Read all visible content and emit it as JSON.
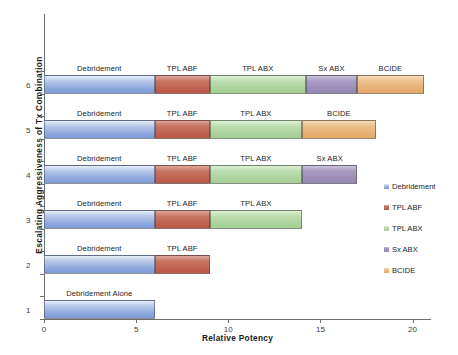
{
  "chart_data": {
    "type": "bar",
    "orientation": "horizontal",
    "stacked": true,
    "title": "",
    "xlabel": "Relative Potency",
    "ylabel": "Escalating Aggressiveness of  Tx  Combination",
    "xlim": [
      0,
      21
    ],
    "xticks": [
      0,
      5,
      10,
      15,
      20
    ],
    "xticklabels": [
      "0",
      "5",
      "10",
      "15",
      "20"
    ],
    "yticks": [
      1,
      2,
      3,
      4,
      5,
      6
    ],
    "yticklabels": [
      "1",
      "2",
      "3",
      "4",
      "5",
      "6"
    ],
    "grid": false,
    "legend_position": "right",
    "series": [
      {
        "name": "Debridement",
        "color": "#8fa9dd",
        "values": [
          6,
          6,
          6,
          6,
          6,
          6
        ]
      },
      {
        "name": "TPL ABF",
        "color": "#c0604f",
        "values": [
          0,
          3,
          3,
          3,
          3,
          3
        ]
      },
      {
        "name": "TPL ABX",
        "color": "#a9d29b",
        "values": [
          0,
          0,
          5,
          5,
          5,
          5
        ]
      },
      {
        "name": "Sx ABX",
        "color": "#9a8cb7",
        "values": [
          0,
          0,
          0,
          3,
          0,
          3
        ]
      },
      {
        "name": "BCIDE",
        "color": "#e6ae72",
        "values": [
          0,
          0,
          0,
          0,
          4,
          3.6
        ]
      }
    ],
    "bars": [
      {
        "category": "1",
        "total": 6,
        "segments": [
          {
            "series": "Debridement",
            "label": "Debridement Alone",
            "start": 0,
            "end": 6,
            "color": "#8fa9dd",
            "fill": "c-debridement"
          }
        ]
      },
      {
        "category": "2",
        "total": 9,
        "segments": [
          {
            "series": "Debridement",
            "label": "Debridement",
            "start": 0,
            "end": 6,
            "color": "#8fa9dd",
            "fill": "c-debridement"
          },
          {
            "series": "TPL ABF",
            "label": "TPL ABF",
            "start": 6,
            "end": 9,
            "color": "#c0604f",
            "fill": "c-tplabf"
          }
        ]
      },
      {
        "category": "3",
        "total": 14,
        "segments": [
          {
            "series": "Debridement",
            "label": "Debridement",
            "start": 0,
            "end": 6,
            "color": "#8fa9dd",
            "fill": "c-debridement"
          },
          {
            "series": "TPL ABF",
            "label": "TPL ABF",
            "start": 6,
            "end": 9,
            "color": "#c0604f",
            "fill": "c-tplabf"
          },
          {
            "series": "TPL ABX",
            "label": "TPL ABX",
            "start": 9,
            "end": 14,
            "color": "#a9d29b",
            "fill": "c-tplabx"
          }
        ]
      },
      {
        "category": "4",
        "total": 17,
        "segments": [
          {
            "series": "Debridement",
            "label": "Debridement",
            "start": 0,
            "end": 6,
            "color": "#8fa9dd",
            "fill": "c-debridement"
          },
          {
            "series": "TPL ABF",
            "label": "TPL ABF",
            "start": 6,
            "end": 9,
            "color": "#c0604f",
            "fill": "c-tplabf"
          },
          {
            "series": "TPL ABX",
            "label": "TPL ABX",
            "start": 9,
            "end": 14,
            "color": "#a9d29b",
            "fill": "c-tplabx"
          },
          {
            "series": "Sx ABX",
            "label": "Sx ABX",
            "start": 14,
            "end": 17,
            "color": "#9a8cb7",
            "fill": "c-sxabx"
          }
        ]
      },
      {
        "category": "5",
        "total": 18,
        "segments": [
          {
            "series": "Debridement",
            "label": "Debridement",
            "start": 0,
            "end": 6,
            "color": "#8fa9dd",
            "fill": "c-debridement"
          },
          {
            "series": "TPL ABF",
            "label": "TPL ABF",
            "start": 6,
            "end": 9,
            "color": "#c0604f",
            "fill": "c-tplabf"
          },
          {
            "series": "TPL ABX",
            "label": "TPL ABX",
            "start": 9,
            "end": 14,
            "color": "#a9d29b",
            "fill": "c-tplabx"
          },
          {
            "series": "BCIDE",
            "label": "BCIDE",
            "start": 14,
            "end": 18,
            "color": "#e6ae72",
            "fill": "c-bcide"
          }
        ]
      },
      {
        "category": "6",
        "total": 20.6,
        "segments": [
          {
            "series": "Debridement",
            "label": "Debridement",
            "start": 0,
            "end": 6,
            "color": "#8fa9dd",
            "fill": "c-debridement"
          },
          {
            "series": "TPL ABF",
            "label": "TPL ABF",
            "start": 6,
            "end": 9,
            "color": "#c0604f",
            "fill": "c-tplabf"
          },
          {
            "series": "TPL ABX",
            "label": "TPL ABX",
            "start": 9,
            "end": 14.2,
            "color": "#a9d29b",
            "fill": "c-tplabx"
          },
          {
            "series": "Sx ABX",
            "label": "Sx ABX",
            "start": 14.2,
            "end": 17,
            "color": "#9a8cb7",
            "fill": "c-sxabx"
          },
          {
            "series": "BCIDE",
            "label": "BCIDE",
            "start": 17,
            "end": 20.6,
            "color": "#e6ae72",
            "fill": "c-bcide"
          }
        ]
      }
    ],
    "legend": [
      {
        "label": "Debridement",
        "color": "#8fa9dd",
        "fill": "c-debridement"
      },
      {
        "label": "TPL ABF",
        "color": "#c0604f",
        "fill": "c-tplabf"
      },
      {
        "label": "TPL ABX",
        "color": "#a9d29b",
        "fill": "c-tplabx"
      },
      {
        "label": "Sx ABX",
        "color": "#9a8cb7",
        "fill": "c-sxabx"
      },
      {
        "label": "BCIDE",
        "color": "#e6ae72",
        "fill": "c-bcide"
      }
    ]
  }
}
